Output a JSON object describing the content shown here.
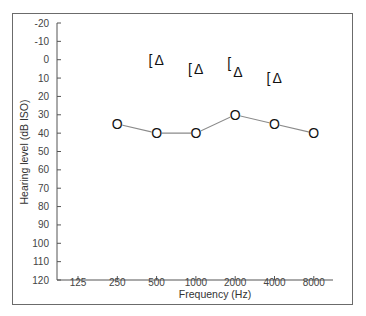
{
  "chart_data": {
    "type": "line",
    "title": "",
    "xlabel": "Frequency (Hz)",
    "ylabel": "Hearing level (dB ISO)",
    "categories": [
      "125",
      "250",
      "500",
      "1000",
      "2000",
      "4000",
      "8000"
    ],
    "y_ticks": [
      "-20",
      "-10",
      "0",
      "10",
      "20",
      "30",
      "40",
      "50",
      "60",
      "70",
      "80",
      "90",
      "100",
      "110",
      "120"
    ],
    "ylim": [
      -20,
      120
    ],
    "y_inverted": true,
    "grid": false,
    "series": [
      {
        "name": "Air conduction (O)",
        "symbol": "O",
        "connected": true,
        "x": [
          "250",
          "500",
          "1000",
          "2000",
          "4000",
          "8000"
        ],
        "values": [
          35,
          40,
          40,
          30,
          35,
          40
        ]
      },
      {
        "name": "Bone conduction (masked) / Δ",
        "symbol": "[Δ",
        "connected": false,
        "x": [
          "500",
          "1000",
          "2000",
          "4000"
        ],
        "values": [
          0,
          5,
          5,
          10
        ]
      }
    ],
    "colors": {
      "line": "#8a8a8a",
      "symbol": "#111111",
      "axis": "#555555",
      "frame": "#6b6b6b"
    }
  }
}
